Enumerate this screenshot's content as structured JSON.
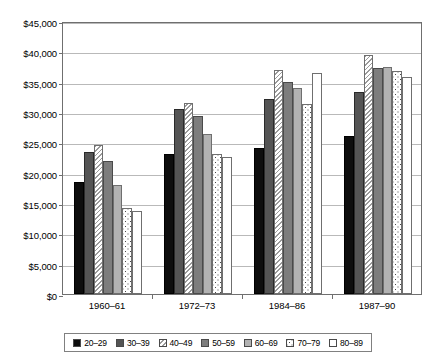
{
  "chart_data": {
    "type": "bar",
    "title": "",
    "xlabel": "",
    "ylabel": "",
    "ylim": [
      0,
      45000
    ],
    "ytick_step": 5000,
    "grid": true,
    "legend_position": "bottom",
    "categories": [
      "1960–61",
      "1972–73",
      "1984–86",
      "1987–90"
    ],
    "ytick_labels": [
      "$0",
      "$5,000",
      "$10,000",
      "$15,000",
      "$20,000",
      "$25,000",
      "$30,000",
      "$35,000",
      "$40,000",
      "$45,000"
    ],
    "ytick_values": [
      0,
      5000,
      10000,
      15000,
      20000,
      25000,
      30000,
      35000,
      40000,
      45000
    ],
    "series": [
      {
        "name": "20–29",
        "pattern": "solid-black",
        "values": [
          18500,
          23100,
          24000,
          26000
        ]
      },
      {
        "name": "30–39",
        "pattern": "dark-gray",
        "values": [
          23400,
          30500,
          32200,
          33300
        ]
      },
      {
        "name": "40–49",
        "pattern": "hatch",
        "values": [
          24500,
          31500,
          37000,
          39400
        ]
      },
      {
        "name": "50–59",
        "pattern": "mid-gray",
        "values": [
          22000,
          29300,
          35000,
          37200
        ]
      },
      {
        "name": "60–69",
        "pattern": "light-gray",
        "values": [
          17900,
          26400,
          34000,
          37400
        ]
      },
      {
        "name": "70–79",
        "pattern": "dotted",
        "values": [
          14200,
          23100,
          31400,
          36700
        ]
      },
      {
        "name": "80–89",
        "pattern": "white",
        "values": [
          13700,
          22600,
          36500,
          35700
        ]
      }
    ]
  },
  "colors": {
    "axis": "#6f6f6f",
    "gridline": "#b9b9b9",
    "legend_border": "#808080",
    "bar_outline": "#4a4a4a",
    "solid_black": "#0d0d0d",
    "dark_gray": "#545454",
    "mid_gray": "#7d7d7d",
    "light_gray": "#b2b2b2",
    "white": "#ffffff"
  }
}
